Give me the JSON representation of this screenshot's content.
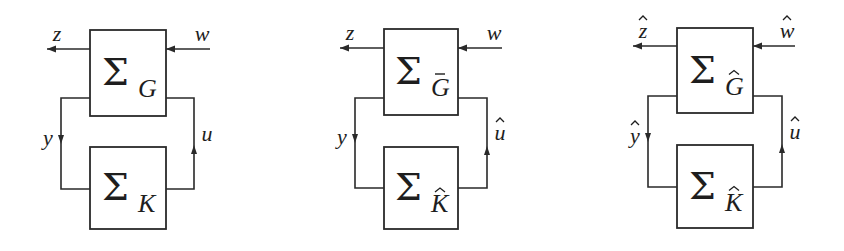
{
  "figure": {
    "colors": {
      "line": "#2a2a2a",
      "text": "#1e1e1e",
      "background": "#ffffff"
    }
  },
  "diagrams": [
    {
      "id": "original-loop",
      "plant": {
        "symbol": "Σ",
        "subscript": "G",
        "accent": ""
      },
      "controller": {
        "symbol": "Σ",
        "subscript": "K",
        "accent": ""
      },
      "signals": {
        "output": {
          "name": "z",
          "accent": ""
        },
        "input": {
          "name": "w",
          "accent": ""
        },
        "measurement": {
          "name": "y",
          "accent": ""
        },
        "control": {
          "name": "u",
          "accent": ""
        }
      },
      "geometry": {
        "top_box": [
          90,
          30,
          166,
          116
        ],
        "bottom_box": [
          90,
          147,
          166,
          229
        ],
        "io_y": 49,
        "out_tip_x": 47,
        "in_start_x": 210,
        "left_x": 61,
        "right_x": 194,
        "top_wire_y": 98,
        "bottom_wire_y": 189,
        "down_arrow_y": 139,
        "up_arrow_y": 150
      }
    },
    {
      "id": "intermediate-loop",
      "plant": {
        "symbol": "Σ",
        "subscript": "G",
        "accent": "bar"
      },
      "controller": {
        "symbol": "Σ",
        "subscript": "K",
        "accent": "hat"
      },
      "signals": {
        "output": {
          "name": "z",
          "accent": ""
        },
        "input": {
          "name": "w",
          "accent": ""
        },
        "measurement": {
          "name": "y",
          "accent": ""
        },
        "control": {
          "name": "u",
          "accent": "hat"
        }
      },
      "geometry": {
        "top_box": [
          384,
          29,
          458,
          115
        ],
        "bottom_box": [
          384,
          147,
          458,
          229
        ],
        "io_y": 48,
        "out_tip_x": 340,
        "in_start_x": 502,
        "left_x": 355,
        "right_x": 487,
        "top_wire_y": 98,
        "bottom_wire_y": 188,
        "down_arrow_y": 138,
        "up_arrow_y": 151
      }
    },
    {
      "id": "transformed-loop",
      "plant": {
        "symbol": "Σ",
        "subscript": "G",
        "accent": "hat"
      },
      "controller": {
        "symbol": "Σ",
        "subscript": "K",
        "accent": "hat"
      },
      "signals": {
        "output": {
          "name": "z",
          "accent": "hat"
        },
        "input": {
          "name": "w",
          "accent": "hat"
        },
        "measurement": {
          "name": "y",
          "accent": "hat"
        },
        "control": {
          "name": "u",
          "accent": "hat"
        }
      },
      "geometry": {
        "top_box": [
          677,
          28,
          753,
          113
        ],
        "bottom_box": [
          677,
          145,
          753,
          228
        ],
        "io_y": 46,
        "out_tip_x": 633,
        "in_start_x": 795,
        "left_x": 648,
        "right_x": 782,
        "top_wire_y": 96,
        "bottom_wire_y": 187,
        "down_arrow_y": 137,
        "up_arrow_y": 149
      }
    }
  ]
}
